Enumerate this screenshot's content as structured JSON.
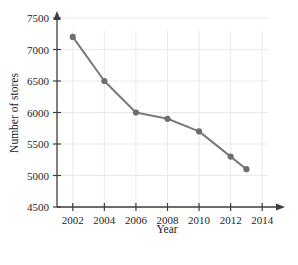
{
  "chart_data": {
    "type": "line",
    "title": "",
    "xlabel": "Year",
    "ylabel": "Number of stores",
    "x": [
      2002,
      2004,
      2006,
      2008,
      2010,
      2012,
      2013
    ],
    "values": [
      7200,
      6500,
      6000,
      5900,
      5700,
      5300,
      5100
    ],
    "series": [
      {
        "name": "Number of stores",
        "values": [
          7200,
          6500,
          6000,
          5900,
          5700,
          5300,
          5100
        ]
      }
    ],
    "xlim": [
      2001,
      2015
    ],
    "ylim": [
      4500,
      7500
    ],
    "xticks": [
      2002,
      2004,
      2006,
      2008,
      2010,
      2012,
      2014
    ],
    "xtick_labels": [
      "2002",
      "2004",
      "2006",
      "2008",
      "2010",
      "2012",
      "2014"
    ],
    "yticks": [
      4500,
      5000,
      5500,
      6000,
      6500,
      7000,
      7500
    ],
    "ytick_labels": [
      "4500",
      "5000",
      "5500",
      "6000",
      "6500",
      "7000",
      "7500"
    ],
    "grid": true,
    "legend": false,
    "legend_position": "none",
    "marker": "circle",
    "colors": {
      "line": "#7a7a7a",
      "marker": "#6e6e6e",
      "axis": "#3d3d3d",
      "grid": "#e9e9e9",
      "text": "#1a1a1a",
      "background": "#ffffff"
    }
  }
}
